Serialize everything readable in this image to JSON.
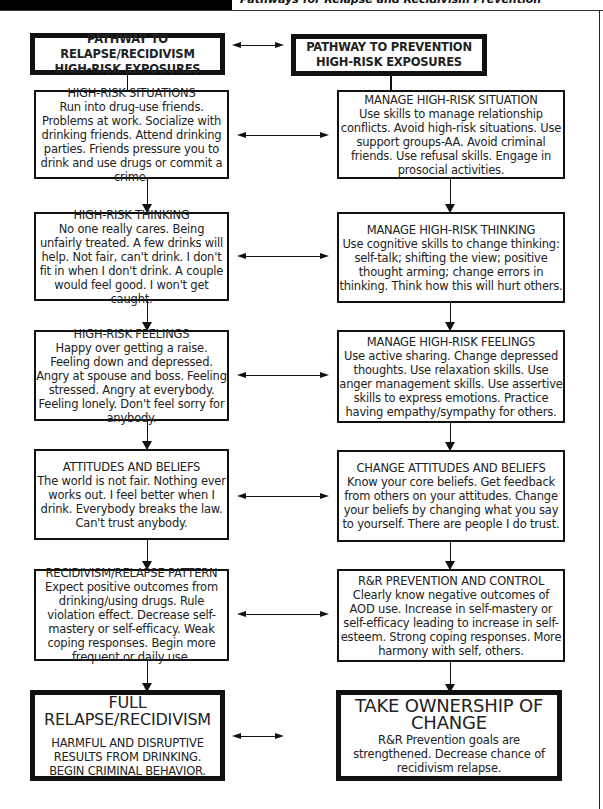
{
  "header": {
    "title": "Pathways for Relapse and Recidivism Prevention"
  },
  "left_column": {
    "heading": {
      "title_line1": "PATHWAY TO RELAPSE/RECIDIVISM",
      "title_line2": "HIGH-RISK EXPOSURES"
    },
    "boxes": [
      {
        "title": "HIGH-RISK SITUATIONS",
        "body": "Run into drug-use friends. Problems at work. Socialize with drinking friends. Attend drinking parties. Friends pressure you to drink and use drugs or commit a crime."
      },
      {
        "title": "HIGH-RISK THINKING",
        "body": "No one really cares. Being unfairly treated. A few drinks will help. Not fair, can't drink. I don't fit in when I don't drink. A couple would feel good. I won't get caught."
      },
      {
        "title": "HIGH-RISK FEELINGS",
        "body": "Happy over getting a raise. Feeling down and depressed. Angry at spouse and boss. Feeling stressed. Angry at everybody. Feeling lonely. Don't feel sorry for anybody."
      },
      {
        "title": "ATTITUDES AND BELIEFS",
        "body": "The world is not fair. Nothing ever works out. I feel better when I drink. Everybody breaks the law. Can't trust anybody."
      },
      {
        "title": "RECIDIVISM/RELAPSE PATTERN",
        "body": "Expect positive outcomes from drinking/using drugs. Rule violation effect. Decrease self-mastery or self-efficacy. Weak coping responses. Begin more frequent or daily use."
      }
    ],
    "final": {
      "title": "FULL RELAPSE/RECIDIVISM",
      "body": "HARMFUL AND DISRUPTIVE RESULTS FROM DRINKING. BEGIN CRIMINAL BEHAVIOR."
    }
  },
  "right_column": {
    "heading": {
      "title_line1": "PATHWAY TO PREVENTION",
      "title_line2": "HIGH-RISK EXPOSURES"
    },
    "boxes": [
      {
        "title": "MANAGE HIGH-RISK SITUATION",
        "body": "Use skills to manage relationship conflicts. Avoid high-risk situations. Use support groups-AA. Avoid criminal friends. Use refusal skills. Engage in prosocial activities."
      },
      {
        "title": "MANAGE HIGH-RISK THINKING",
        "body": "Use cognitive skills to change thinking: self-talk; shifting the view; positive thought arming; change errors in thinking. Think how this will hurt others."
      },
      {
        "title": "MANAGE HIGH-RISK FEELINGS",
        "body": "Use active sharing. Change depressed thoughts. Use relaxation skills. Use anger management skills. Use assertive skills to express emotions. Practice having empathy/sympathy for others."
      },
      {
        "title": "CHANGE ATTITUDES AND BELIEFS",
        "body": "Know your core beliefs. Get feedback from others on your attitudes. Change your beliefs by changing what you say to yourself. There are people I do trust."
      },
      {
        "title": "R&R PREVENTION AND CONTROL",
        "body": "Clearly know negative outcomes of AOD use. Increase in self-mastery or self-efficacy leading to increase in self-esteem. Strong coping responses. More harmony with self, others."
      }
    ],
    "final": {
      "title": "TAKE OWNERSHIP OF CHANGE",
      "body": "R&R Prevention goals are strengthened. Decrease chance of recidivism relapse."
    }
  },
  "connectors": {
    "horizontal_arrows": "bidirectional",
    "vertical_arrows": "down"
  }
}
